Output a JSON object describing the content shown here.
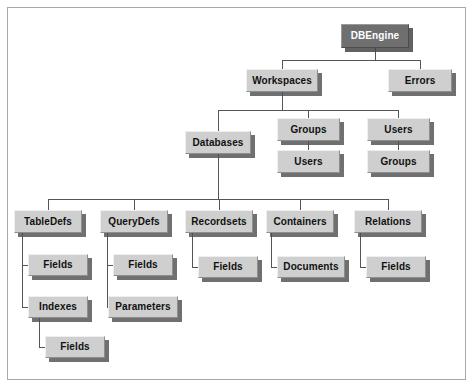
{
  "diagram": {
    "type": "tree",
    "colors": {
      "node_fill": "#cfcfcf",
      "root_fill": "#6f6f6f",
      "root_text": "#ffffff",
      "node_text": "#111111",
      "connector": "#555555",
      "frame_border": "#a8a8a8",
      "background": "#ffffff"
    },
    "nodes": [
      {
        "id": "dbengine",
        "label": "DBEngine",
        "x": 341,
        "y": 24,
        "w": 68,
        "h": 24,
        "root": true
      },
      {
        "id": "workspaces",
        "label": "Workspaces",
        "x": 246,
        "y": 69,
        "w": 72,
        "h": 23,
        "root": false
      },
      {
        "id": "errors",
        "label": "Errors",
        "x": 388,
        "y": 69,
        "w": 64,
        "h": 23,
        "root": false
      },
      {
        "id": "databases",
        "label": "Databases",
        "x": 185,
        "y": 131,
        "w": 66,
        "h": 23,
        "root": false
      },
      {
        "id": "ws-groups",
        "label": "Groups",
        "x": 277,
        "y": 118,
        "w": 63,
        "h": 23,
        "root": false
      },
      {
        "id": "ws-users",
        "label": "Users",
        "x": 367,
        "y": 118,
        "w": 63,
        "h": 23,
        "root": false
      },
      {
        "id": "groups-users",
        "label": "Users",
        "x": 277,
        "y": 150,
        "w": 63,
        "h": 23,
        "root": false
      },
      {
        "id": "users-groups",
        "label": "Groups",
        "x": 367,
        "y": 150,
        "w": 63,
        "h": 23,
        "root": false
      },
      {
        "id": "tabledefs",
        "label": "TableDefs",
        "x": 14,
        "y": 210,
        "w": 68,
        "h": 23,
        "root": false
      },
      {
        "id": "querydefs",
        "label": "QueryDefs",
        "x": 100,
        "y": 210,
        "w": 68,
        "h": 23,
        "root": false
      },
      {
        "id": "recordsets",
        "label": "Recordsets",
        "x": 185,
        "y": 210,
        "w": 68,
        "h": 23,
        "root": false
      },
      {
        "id": "containers",
        "label": "Containers",
        "x": 266,
        "y": 210,
        "w": 68,
        "h": 23,
        "root": false
      },
      {
        "id": "relations",
        "label": "Relations",
        "x": 354,
        "y": 210,
        "w": 68,
        "h": 23,
        "root": false
      },
      {
        "id": "td-fields",
        "label": "Fields",
        "x": 28,
        "y": 254,
        "w": 60,
        "h": 22,
        "root": false
      },
      {
        "id": "td-indexes",
        "label": "Indexes",
        "x": 28,
        "y": 296,
        "w": 60,
        "h": 22,
        "root": false
      },
      {
        "id": "idx-fields",
        "label": "Fields",
        "x": 45,
        "y": 336,
        "w": 60,
        "h": 22,
        "root": false
      },
      {
        "id": "qd-fields",
        "label": "Fields",
        "x": 113,
        "y": 254,
        "w": 60,
        "h": 22,
        "root": false
      },
      {
        "id": "qd-parameters",
        "label": "Parameters",
        "x": 108,
        "y": 296,
        "w": 70,
        "h": 22,
        "root": false
      },
      {
        "id": "rs-fields",
        "label": "Fields",
        "x": 198,
        "y": 256,
        "w": 60,
        "h": 22,
        "root": false
      },
      {
        "id": "ct-documents",
        "label": "Documents",
        "x": 277,
        "y": 256,
        "w": 68,
        "h": 22,
        "root": false
      },
      {
        "id": "rl-fields",
        "label": "Fields",
        "x": 366,
        "y": 256,
        "w": 60,
        "h": 22,
        "root": false
      }
    ],
    "edges": [
      {
        "from": "dbengine",
        "to": "workspaces"
      },
      {
        "from": "dbengine",
        "to": "errors"
      },
      {
        "from": "workspaces",
        "to": "databases"
      },
      {
        "from": "workspaces",
        "to": "ws-groups"
      },
      {
        "from": "workspaces",
        "to": "ws-users"
      },
      {
        "from": "ws-groups",
        "to": "groups-users"
      },
      {
        "from": "ws-users",
        "to": "users-groups"
      },
      {
        "from": "databases",
        "to": "tabledefs"
      },
      {
        "from": "databases",
        "to": "querydefs"
      },
      {
        "from": "databases",
        "to": "recordsets"
      },
      {
        "from": "databases",
        "to": "containers"
      },
      {
        "from": "databases",
        "to": "relations"
      },
      {
        "from": "tabledefs",
        "to": "td-fields"
      },
      {
        "from": "tabledefs",
        "to": "td-indexes"
      },
      {
        "from": "td-indexes",
        "to": "idx-fields"
      },
      {
        "from": "querydefs",
        "to": "qd-fields"
      },
      {
        "from": "querydefs",
        "to": "qd-parameters"
      },
      {
        "from": "recordsets",
        "to": "rs-fields"
      },
      {
        "from": "containers",
        "to": "ct-documents"
      },
      {
        "from": "relations",
        "to": "rl-fields"
      }
    ]
  }
}
